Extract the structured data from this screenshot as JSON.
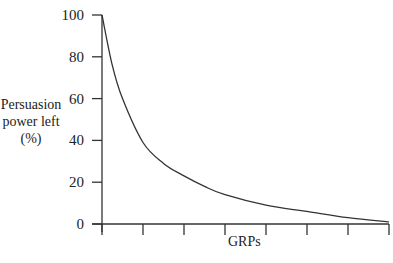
{
  "chart_data": {
    "type": "line",
    "title": "",
    "xlabel": "GRPs",
    "ylabel": "Persuasion power left (%)",
    "ylabel_lines": [
      "Persuasion",
      "power left",
      "(%)"
    ],
    "y_ticks": [
      0,
      20,
      40,
      60,
      80,
      100
    ],
    "x_ticks_count": 8,
    "x_tick_labels": [],
    "ylim": [
      0,
      100
    ],
    "grid": false,
    "legend": null,
    "series": [
      {
        "name": "Persuasion power left",
        "x": [
          0,
          0.25,
          0.5,
          1,
          1.5,
          2,
          2.5,
          3,
          4,
          5,
          6,
          7
        ],
        "values": [
          100,
          76,
          60,
          39,
          29,
          23,
          18,
          14,
          9,
          6,
          3,
          1
        ]
      }
    ],
    "colors": {
      "line": "#333333",
      "axis": "#333333"
    }
  }
}
